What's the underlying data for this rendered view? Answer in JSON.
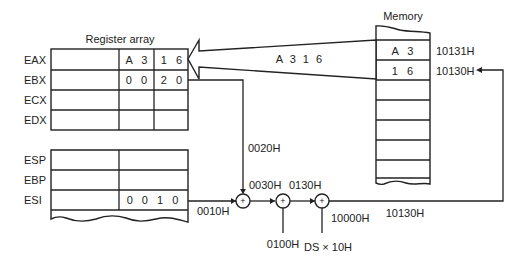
{
  "register_array": {
    "title": "Register array",
    "general_registers": [
      {
        "name": "EAX",
        "high_byte": "A 3",
        "low_byte": "1 6"
      },
      {
        "name": "EBX",
        "high_byte": "0 0",
        "low_byte": "2 0"
      },
      {
        "name": "ECX",
        "high_byte": "",
        "low_byte": ""
      },
      {
        "name": "EDX",
        "high_byte": "",
        "low_byte": ""
      }
    ],
    "pointer_registers": [
      {
        "name": "ESP",
        "value": ""
      },
      {
        "name": "EBP",
        "value": ""
      },
      {
        "name": "ESI",
        "value": "0 0 1 0"
      }
    ]
  },
  "memory": {
    "title": "Memory",
    "cells": [
      {
        "value": "A 3",
        "address": "10131H"
      },
      {
        "value": "1 6",
        "address": "10130H"
      }
    ]
  },
  "data_transfer_label": "A 3 1 6",
  "address_calculation": {
    "esi_out": "0010H",
    "ebx_out": "0020H",
    "sum1": "0030H",
    "displacement": "0100H",
    "sum2": "0130H",
    "segment_input": "DS × 10H",
    "segment_base": "10000H",
    "physical_address": "10130H",
    "adder_symbol": "+"
  }
}
